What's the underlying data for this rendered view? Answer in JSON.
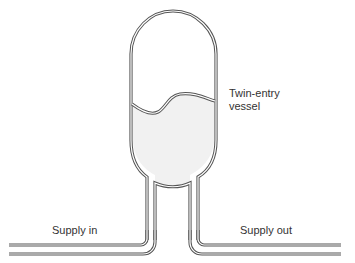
{
  "diagram": {
    "labels": {
      "vessel_line1": "Twin-entry",
      "vessel_line2": "vessel",
      "supply_in": "Supply in",
      "supply_out": "Supply out"
    },
    "colors": {
      "outline": "#555555",
      "pipe_fill": "#ffffff",
      "fluid": "#f1f1f1",
      "text": "#333333",
      "background": "#ffffff"
    }
  }
}
